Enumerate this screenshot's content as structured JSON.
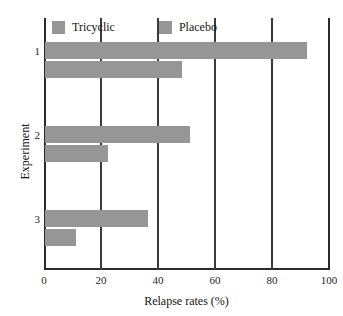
{
  "chart_data": {
    "type": "bar",
    "orientation": "horizontal",
    "title": "",
    "xlabel": "Relapse rates (%)",
    "ylabel": "Experiment",
    "categories": [
      "1",
      "2",
      "3"
    ],
    "xticks": [
      "0",
      "20",
      "40",
      "60",
      "80",
      "100"
    ],
    "xlim": [
      0,
      100
    ],
    "grid": "vertical",
    "legend_position": "top-left",
    "series": [
      {
        "name": "Tricyclic",
        "color": "#969696",
        "values": [
          92,
          51,
          36
        ]
      },
      {
        "name": "Placebo",
        "color": "#969696",
        "values": [
          48,
          22,
          11
        ]
      }
    ]
  },
  "legend": {
    "entries": [
      {
        "label": "Tricyclic",
        "swatch": "legend-swatch-tricyclic"
      },
      {
        "label": "Placebo",
        "swatch": "legend-swatch-placebo"
      }
    ]
  }
}
